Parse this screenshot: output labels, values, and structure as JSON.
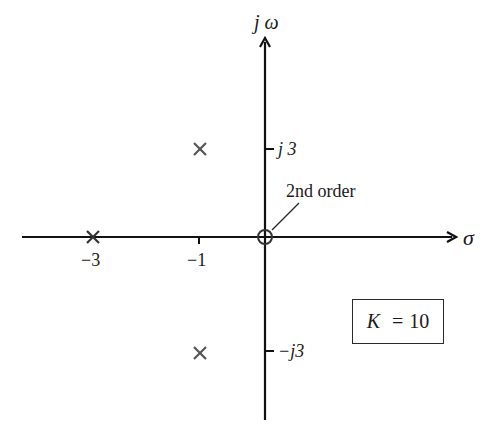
{
  "diagram": {
    "type": "pole-zero plot (s-plane)",
    "axes": {
      "horizontal_label": "σ",
      "vertical_label": "j ω"
    },
    "tick_labels": {
      "x": [
        {
          "value": -3,
          "label": "−3"
        },
        {
          "value": -1,
          "label": "−1"
        }
      ],
      "y": [
        {
          "value": 3,
          "label": "j 3"
        },
        {
          "value": -3,
          "label": "−j3"
        }
      ]
    },
    "poles": [
      {
        "re": -3,
        "im": 0,
        "marker": "x"
      },
      {
        "re": -1,
        "im": 3,
        "marker": "x"
      },
      {
        "re": -1,
        "im": -3,
        "marker": "x"
      }
    ],
    "zeros": [
      {
        "re": 0,
        "im": 0,
        "marker": "o",
        "order": 2
      }
    ],
    "annotation": "2nd order",
    "gain_box": {
      "symbol": "K",
      "equals": "=",
      "value": "10"
    },
    "colors": {
      "axis": "#111111",
      "marker": "#555555",
      "text": "#1a1a1a"
    }
  }
}
